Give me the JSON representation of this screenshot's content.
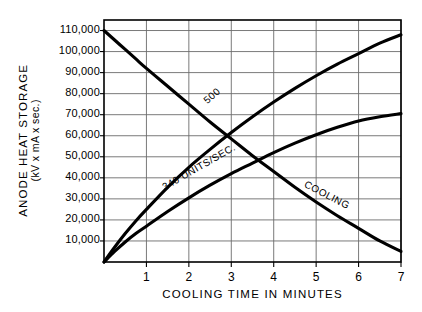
{
  "chart_data": {
    "type": "line",
    "title": "",
    "xlabel": "COOLING TIME IN MINUTES",
    "ylabel_line1": "ANODE HEAT STORAGE",
    "ylabel_line2": "(kV x mA x sec.)",
    "xlim": [
      0,
      7
    ],
    "ylim": [
      0,
      115000
    ],
    "grid": true,
    "legend": "inline-curve-labels",
    "xticks": [
      1,
      2,
      3,
      4,
      5,
      6,
      7
    ],
    "xtick_labels": [
      "1",
      "2",
      "3",
      "4",
      "5",
      "6",
      "7"
    ],
    "yticks": [
      10000,
      20000,
      30000,
      40000,
      50000,
      60000,
      70000,
      80000,
      90000,
      100000,
      110000
    ],
    "ytick_labels": [
      "10,000",
      "20,000",
      "30,000",
      "40,000",
      "50,000",
      "60,000",
      "70,000",
      "80,000",
      "90,000",
      "100,000",
      "110,000"
    ],
    "series": [
      {
        "name": "500",
        "label": "500",
        "kind": "heating",
        "x": [
          0,
          0.25,
          0.5,
          0.75,
          1,
          1.5,
          2,
          2.5,
          3,
          3.5,
          4,
          4.5,
          5,
          5.5,
          6,
          6.5,
          7
        ],
        "y": [
          0,
          7000,
          13500,
          19500,
          25000,
          35500,
          45000,
          53500,
          61500,
          69000,
          76000,
          82500,
          88500,
          94000,
          99000,
          104000,
          108000
        ]
      },
      {
        "name": "340 UNITS/SEC.",
        "label": "340 UNITS/SEC.",
        "kind": "heating",
        "x": [
          0,
          0.25,
          0.5,
          0.75,
          1,
          1.5,
          2,
          2.5,
          3,
          3.5,
          4,
          4.5,
          5,
          5.5,
          6,
          6.5,
          7
        ],
        "y": [
          0,
          5000,
          9500,
          13500,
          17000,
          24000,
          30500,
          36500,
          42000,
          47000,
          52000,
          56500,
          60500,
          64000,
          67000,
          69000,
          70500
        ]
      },
      {
        "name": "COOLING",
        "label": "COOLING",
        "kind": "cooling",
        "x": [
          0,
          0.25,
          0.5,
          0.75,
          1,
          1.5,
          2,
          2.5,
          3,
          3.5,
          4,
          4.5,
          5,
          5.5,
          6,
          6.5,
          7
        ],
        "y": [
          110000,
          105500,
          101000,
          96500,
          92000,
          83500,
          75000,
          66500,
          58500,
          50500,
          43000,
          35500,
          28500,
          22000,
          16000,
          10000,
          5000
        ]
      }
    ],
    "annotations": [
      {
        "text": "500",
        "x": 3.0,
        "y": 63000
      },
      {
        "text": "340 UNITS/SEC.",
        "x": 2.5,
        "y": 42000
      },
      {
        "text": "COOLING",
        "x": 5.2,
        "y": 36000
      }
    ],
    "colors": {
      "background": "#ffffff",
      "axis": "#000000",
      "grid": "#6b6b6b",
      "curve": "#000000"
    }
  }
}
